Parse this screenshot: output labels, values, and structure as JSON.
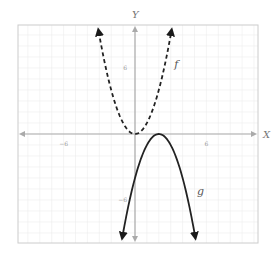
{
  "chart_data": {
    "type": "line",
    "title": "",
    "xlabel": "X",
    "ylabel": "Y",
    "xlim": [
      -10,
      10
    ],
    "ylim": [
      -10,
      10
    ],
    "grid": true,
    "x_ticks": [
      {
        "value": -6,
        "label": "−6"
      },
      {
        "value": 6,
        "label": "6"
      }
    ],
    "y_ticks": [
      {
        "value": 6,
        "label": "6"
      },
      {
        "value": -6,
        "label": "−6"
      }
    ],
    "series": [
      {
        "name": "f",
        "label": "f",
        "style": "dashed",
        "color": "#222222",
        "expression": "x^2",
        "domain": [
          -3.05,
          3.05
        ],
        "label_at": [
          3.3,
          6
        ]
      },
      {
        "name": "g",
        "label": "g",
        "style": "solid",
        "color": "#222222",
        "expression": "-(x-2)^2",
        "domain": [
          -1.05,
          5.05
        ],
        "label_at": [
          5.2,
          -5.5
        ]
      }
    ],
    "axis_color": "#aaaaaa",
    "grid_color": "#ededed",
    "border_color": "#cccccc"
  }
}
